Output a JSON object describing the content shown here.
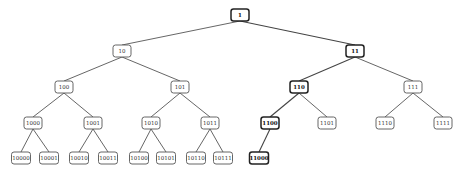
{
  "diagram": {
    "type": "binary-tree",
    "highlight_path": [
      "1",
      "11",
      "110",
      "1100",
      "11000"
    ],
    "nodes": [
      {
        "id": "1",
        "label": "1",
        "x": 240,
        "y": 15,
        "w": 18,
        "h": 12,
        "highlight": true
      },
      {
        "id": "10",
        "label": "10",
        "x": 122,
        "y": 51,
        "w": 18,
        "h": 12,
        "highlight": false
      },
      {
        "id": "11",
        "label": "11",
        "x": 355,
        "y": 51,
        "w": 18,
        "h": 12,
        "highlight": true
      },
      {
        "id": "100",
        "label": "100",
        "x": 64,
        "y": 87,
        "w": 18,
        "h": 12,
        "highlight": false
      },
      {
        "id": "101",
        "label": "101",
        "x": 180,
        "y": 87,
        "w": 18,
        "h": 12,
        "highlight": false
      },
      {
        "id": "110",
        "label": "110",
        "x": 299,
        "y": 87,
        "w": 18,
        "h": 12,
        "highlight": true
      },
      {
        "id": "111",
        "label": "111",
        "x": 413,
        "y": 87,
        "w": 18,
        "h": 12,
        "highlight": false
      },
      {
        "id": "1000",
        "label": "1000",
        "x": 33,
        "y": 123,
        "w": 18,
        "h": 12,
        "highlight": false
      },
      {
        "id": "1001",
        "label": "1001",
        "x": 93,
        "y": 123,
        "w": 18,
        "h": 12,
        "highlight": false
      },
      {
        "id": "1010",
        "label": "1010",
        "x": 151,
        "y": 123,
        "w": 18,
        "h": 12,
        "highlight": false
      },
      {
        "id": "1011",
        "label": "1011",
        "x": 210,
        "y": 123,
        "w": 18,
        "h": 12,
        "highlight": false
      },
      {
        "id": "1100",
        "label": "1100",
        "x": 270,
        "y": 123,
        "w": 18,
        "h": 12,
        "highlight": true
      },
      {
        "id": "1101",
        "label": "1101",
        "x": 327,
        "y": 123,
        "w": 18,
        "h": 12,
        "highlight": false
      },
      {
        "id": "1110",
        "label": "1110",
        "x": 385,
        "y": 123,
        "w": 18,
        "h": 12,
        "highlight": false
      },
      {
        "id": "1111",
        "label": "1111",
        "x": 443,
        "y": 123,
        "w": 18,
        "h": 12,
        "highlight": false
      },
      {
        "id": "10000",
        "label": "10000",
        "x": 21,
        "y": 158,
        "w": 19,
        "h": 12,
        "highlight": false
      },
      {
        "id": "10001",
        "label": "10001",
        "x": 49,
        "y": 158,
        "w": 19,
        "h": 12,
        "highlight": false
      },
      {
        "id": "10010",
        "label": "10010",
        "x": 79,
        "y": 158,
        "w": 19,
        "h": 12,
        "highlight": false
      },
      {
        "id": "10011",
        "label": "10011",
        "x": 108,
        "y": 158,
        "w": 19,
        "h": 12,
        "highlight": false
      },
      {
        "id": "10100",
        "label": "10100",
        "x": 139,
        "y": 158,
        "w": 19,
        "h": 12,
        "highlight": false
      },
      {
        "id": "10101",
        "label": "10101",
        "x": 166,
        "y": 158,
        "w": 19,
        "h": 12,
        "highlight": false
      },
      {
        "id": "10110",
        "label": "10110",
        "x": 196,
        "y": 158,
        "w": 19,
        "h": 12,
        "highlight": false
      },
      {
        "id": "10111",
        "label": "10111",
        "x": 223,
        "y": 158,
        "w": 19,
        "h": 12,
        "highlight": false
      },
      {
        "id": "11000",
        "label": "11000",
        "x": 259,
        "y": 158,
        "w": 19,
        "h": 12,
        "highlight": true
      }
    ],
    "edges": [
      [
        "1",
        "10"
      ],
      [
        "1",
        "11"
      ],
      [
        "10",
        "100"
      ],
      [
        "10",
        "101"
      ],
      [
        "11",
        "110"
      ],
      [
        "11",
        "111"
      ],
      [
        "100",
        "1000"
      ],
      [
        "100",
        "1001"
      ],
      [
        "101",
        "1010"
      ],
      [
        "101",
        "1011"
      ],
      [
        "110",
        "1100"
      ],
      [
        "110",
        "1101"
      ],
      [
        "111",
        "1110"
      ],
      [
        "111",
        "1111"
      ],
      [
        "1000",
        "10000"
      ],
      [
        "1000",
        "10001"
      ],
      [
        "1001",
        "10010"
      ],
      [
        "1001",
        "10011"
      ],
      [
        "1010",
        "10100"
      ],
      [
        "1010",
        "10101"
      ],
      [
        "1011",
        "10110"
      ],
      [
        "1011",
        "10111"
      ],
      [
        "1100",
        "11000"
      ]
    ]
  }
}
